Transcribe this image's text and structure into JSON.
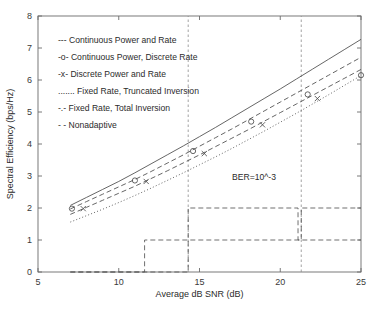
{
  "chart_data": {
    "type": "line",
    "title": "",
    "xlabel": "Average dB SNR (dB)",
    "ylabel": "Spectral Efficiency (bps/Hz)",
    "xlim": [
      5,
      25
    ],
    "ylim": [
      0,
      8
    ],
    "xticks": [
      5,
      10,
      15,
      20,
      25
    ],
    "yticks": [
      0,
      1,
      2,
      3,
      4,
      5,
      6,
      7,
      8
    ],
    "grid": false,
    "legend_position": "upper-left",
    "annotations": [
      {
        "text": "BER=10^-3",
        "x": 18.1,
        "y": 2.95
      }
    ],
    "vertical_markers": [
      14.3,
      21.3
    ],
    "series": [
      {
        "name": "Continuous Power and Rate",
        "legend_prefix": "---",
        "style": "solid",
        "marker": "none",
        "x": [
          7,
          8,
          9,
          10,
          11,
          12,
          13,
          14,
          15,
          16,
          17,
          18,
          19,
          20,
          21,
          22,
          23,
          24,
          25
        ],
        "y": [
          2.08,
          2.33,
          2.58,
          2.83,
          3.1,
          3.38,
          3.66,
          3.94,
          4.23,
          4.52,
          4.82,
          5.12,
          5.42,
          5.72,
          6.03,
          6.34,
          6.65,
          6.96,
          7.27
        ]
      },
      {
        "name": "Continuous Power, Discrete Rate",
        "legend_prefix": "-o-",
        "style": "dashed",
        "marker": "circle",
        "marker_x": [
          7.1,
          11.0,
          14.6,
          18.2,
          21.7,
          25.0
        ],
        "marker_y": [
          1.98,
          2.86,
          3.78,
          4.7,
          5.55,
          6.15
        ],
        "x": [
          7,
          8,
          9,
          10,
          11,
          12,
          13,
          14,
          15,
          16,
          17,
          18,
          19,
          20,
          21,
          22,
          23,
          24,
          25
        ],
        "y": [
          1.97,
          2.2,
          2.43,
          2.66,
          2.89,
          3.14,
          3.4,
          3.66,
          3.93,
          4.2,
          4.47,
          4.75,
          5.03,
          5.31,
          5.59,
          5.87,
          6.15,
          6.43,
          6.71
        ]
      },
      {
        "name": "Discrete Power and Rate",
        "legend_prefix": "-x-",
        "style": "dashed",
        "marker": "cross",
        "marker_x": [
          7.8,
          11.7,
          15.3,
          18.9,
          22.3
        ],
        "marker_y": [
          1.98,
          2.83,
          3.7,
          4.6,
          5.42
        ],
        "x": [
          7,
          8,
          9,
          10,
          11,
          12,
          13,
          14,
          15,
          16,
          17,
          18,
          19,
          20,
          21,
          22,
          23,
          24,
          25
        ],
        "y": [
          1.8,
          2.02,
          2.24,
          2.46,
          2.68,
          2.92,
          3.16,
          3.41,
          3.66,
          3.92,
          4.18,
          4.44,
          4.71,
          4.98,
          5.25,
          5.52,
          5.79,
          6.06,
          6.33
        ]
      },
      {
        "name": "Fixed Rate, Truncated Inversion",
        "legend_prefix": ".......",
        "style": "dotted",
        "marker": "none",
        "x": [
          7,
          8,
          9,
          10,
          11,
          12,
          13,
          14,
          15,
          16,
          17,
          18,
          19,
          20,
          21,
          22,
          23,
          24,
          25
        ],
        "y": [
          1.56,
          1.76,
          1.96,
          2.17,
          2.39,
          2.62,
          2.86,
          3.1,
          3.35,
          3.6,
          3.86,
          4.13,
          4.4,
          4.68,
          4.96,
          5.25,
          5.54,
          5.84,
          6.14
        ]
      },
      {
        "name": "Fixed Rate, Total Inversion",
        "legend_prefix": "-.-",
        "style": "dashdot",
        "marker": "none",
        "step_x": [
          7,
          14.3,
          14.3,
          21.3,
          21.3,
          25
        ],
        "step_y": [
          0,
          0,
          1,
          1,
          2,
          2
        ]
      },
      {
        "name": "Nonadaptive",
        "legend_prefix": "- -",
        "style": "dashed2",
        "marker": "none",
        "step_x": [
          7,
          11.6,
          11.6,
          14.3,
          14.3,
          21.1,
          21.1,
          25
        ],
        "step_y": [
          0,
          0,
          1,
          1,
          2,
          2,
          1,
          1
        ]
      }
    ]
  },
  "legend": {
    "entries": [
      {
        "prefix": "---",
        "label": "Continuous Power and Rate"
      },
      {
        "prefix": "-o-",
        "label": "Continuous Power, Discrete Rate"
      },
      {
        "prefix": "-x-",
        "label": "Discrete Power and Rate"
      },
      {
        "prefix": ".......",
        "label": "Fixed Rate, Truncated Inversion"
      },
      {
        "prefix": "-.-",
        "label": "Fixed Rate, Total Inversion"
      },
      {
        "prefix": "- -",
        "label": "Nonadaptive"
      }
    ]
  },
  "annotation": {
    "ber": "BER=10^-3"
  },
  "axes": {
    "x_title": "Average dB SNR (dB)",
    "y_title": "Spectral Efficiency (bps/Hz)",
    "x_tick_labels": [
      "5",
      "10",
      "15",
      "20",
      "25"
    ],
    "y_tick_labels": [
      "0",
      "1",
      "2",
      "3",
      "4",
      "5",
      "6",
      "7",
      "8"
    ]
  }
}
